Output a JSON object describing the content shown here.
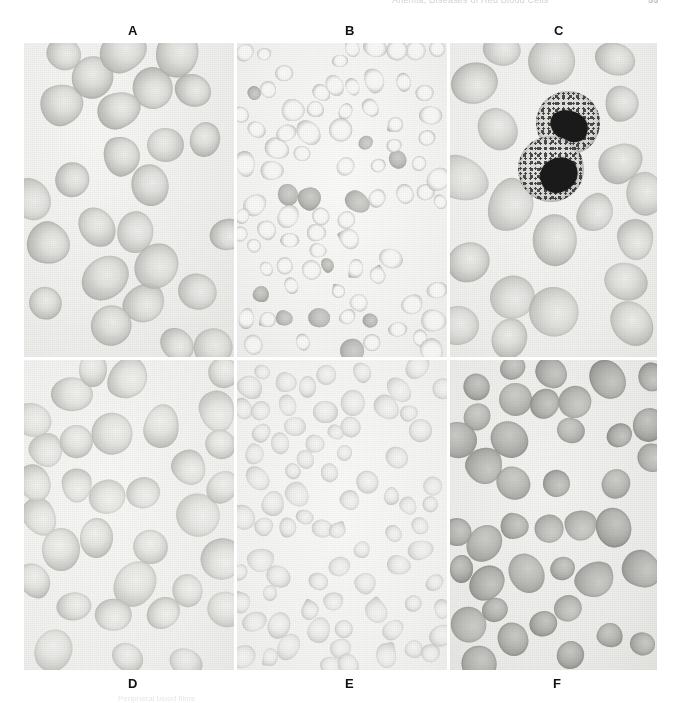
{
  "page": {
    "running_header_left": "",
    "running_header_center": "Anemia, Diseases of Red Blood Cells",
    "page_number": "55"
  },
  "figure": {
    "caption": "Peripheral blood films",
    "labels": [
      {
        "id": "A",
        "text": "A"
      },
      {
        "id": "B",
        "text": "B"
      },
      {
        "id": "C",
        "text": "C"
      },
      {
        "id": "D",
        "text": "D"
      },
      {
        "id": "E",
        "text": "E"
      },
      {
        "id": "F",
        "text": "F"
      }
    ],
    "panels": [
      {
        "id": "A",
        "label": "A",
        "description": "Normocytic normochromic red cells, evenly spaced discocytes with central pallor",
        "cell_count": 26,
        "cell_size": "large",
        "tone": "medium grey"
      },
      {
        "id": "B",
        "label": "B",
        "description": "Microcytic hypochromic red cells, thin dark rims with wide pale centers, anisocytosis",
        "cell_count": 86,
        "cell_size": "small",
        "tone": "pale"
      },
      {
        "id": "C",
        "label": "C",
        "description": "Red cells with two granulocytes showing dark lobed nuclei and granular cytoplasm",
        "cell_count": 20,
        "cell_size": "large",
        "tone": "medium grey",
        "granulocytes": 2
      },
      {
        "id": "D",
        "label": "D",
        "description": "Macrocytic red cells, large pale oval cells with reduced central pallor",
        "cell_count": 33,
        "cell_size": "large",
        "tone": "pale grey"
      },
      {
        "id": "E",
        "label": "E",
        "description": "Small pale red cells with occasional teardrop and elliptical forms",
        "cell_count": 78,
        "cell_size": "small",
        "tone": "very pale"
      },
      {
        "id": "F",
        "label": "F",
        "description": "Densely stained spherocytic red cells lacking central pallor",
        "cell_count": 40,
        "cell_size": "medium",
        "tone": "dark grey"
      }
    ]
  },
  "colors": {
    "background": "#ffffff",
    "label_text": "#111111",
    "header_text": "#d2d2d2",
    "field_light": "#f6f6f4",
    "cell_mid": "#c4c4c0",
    "cell_dark": "#9d9d99",
    "nucleus": "#1a1a1a"
  }
}
